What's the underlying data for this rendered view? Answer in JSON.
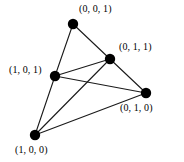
{
  "figure": {
    "type": "vertex-labeled-graph",
    "background_color": "#ffffff",
    "node_color": "#000000",
    "edge_color": "#1a1a1a",
    "label_color": "#000000",
    "node_radius": 5.2,
    "edge_width": 1.1,
    "width": 184,
    "height": 162
  },
  "nodes": [
    {
      "id": "001",
      "label": "(0, 0, 1)",
      "x": 73,
      "y": 24,
      "label_x": 79,
      "label_y": 3,
      "label_anchor": "left"
    },
    {
      "id": "011",
      "label": "(0, 1, 1)",
      "x": 110,
      "y": 59,
      "label_x": 119,
      "label_y": 41,
      "label_anchor": "left"
    },
    {
      "id": "101",
      "label": "(1, 0, 1)",
      "x": 55,
      "y": 76,
      "label_x": 9,
      "label_y": 64,
      "label_anchor": "left"
    },
    {
      "id": "010",
      "label": "(0, 1, 0)",
      "x": 146,
      "y": 93,
      "label_x": 120,
      "label_y": 102,
      "label_anchor": "left"
    },
    {
      "id": "100",
      "label": "(1, 0, 0)",
      "x": 35,
      "y": 135,
      "label_x": 15,
      "label_y": 144,
      "label_anchor": "left"
    }
  ],
  "edges": [
    {
      "id": "e1",
      "from": "001",
      "to": "101",
      "x1": 73,
      "y1": 24,
      "x2": 55,
      "y2": 76
    },
    {
      "id": "e2",
      "from": "001",
      "to": "011",
      "x1": 73,
      "y1": 24,
      "x2": 110,
      "y2": 59
    },
    {
      "id": "e3",
      "from": "101",
      "to": "011",
      "x1": 55,
      "y1": 76,
      "x2": 110,
      "y2": 59
    },
    {
      "id": "e4",
      "from": "101",
      "to": "010",
      "x1": 55,
      "y1": 76,
      "x2": 146,
      "y2": 93
    },
    {
      "id": "e5",
      "from": "101",
      "to": "100",
      "x1": 55,
      "y1": 76,
      "x2": 35,
      "y2": 135
    },
    {
      "id": "e6",
      "from": "011",
      "to": "010",
      "x1": 110,
      "y1": 59,
      "x2": 146,
      "y2": 93
    },
    {
      "id": "e7",
      "from": "011",
      "to": "100",
      "x1": 110,
      "y1": 59,
      "x2": 35,
      "y2": 135
    },
    {
      "id": "e8",
      "from": "100",
      "to": "010",
      "x1": 35,
      "y1": 135,
      "x2": 146,
      "y2": 93
    }
  ]
}
